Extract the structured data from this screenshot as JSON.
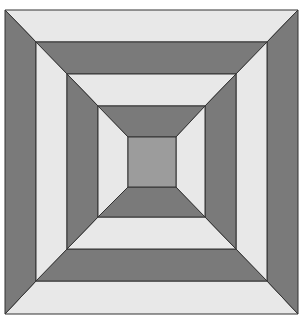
{
  "figure": {
    "colors": {
      "light": "#e8e8e8",
      "dark": "#7a7a7a",
      "center": "#9c9c9c",
      "stroke": "#333333",
      "background": "#ffffff"
    },
    "rings": [
      {
        "name": "ring-1",
        "outer": [
          5,
          10,
          298,
          314
        ],
        "inner": [
          36,
          42,
          267,
          281
        ],
        "top": "light",
        "bottom": "light",
        "left": "dark",
        "right": "dark"
      },
      {
        "name": "ring-2",
        "outer": [
          36,
          42,
          267,
          281
        ],
        "inner": [
          67,
          74,
          236,
          249
        ],
        "top": "dark",
        "bottom": "dark",
        "left": "light",
        "right": "light"
      },
      {
        "name": "ring-3",
        "outer": [
          67,
          74,
          236,
          249
        ],
        "inner": [
          98,
          106,
          205,
          217
        ],
        "top": "light",
        "bottom": "light",
        "left": "dark",
        "right": "dark"
      },
      {
        "name": "ring-4",
        "outer": [
          98,
          106,
          205,
          217
        ],
        "inner": [
          128,
          137,
          176,
          187
        ],
        "top": "dark",
        "bottom": "dark",
        "left": "light",
        "right": "light"
      }
    ],
    "center": {
      "name": "center-square",
      "rect": [
        128,
        137,
        176,
        187
      ],
      "color": "center"
    }
  }
}
